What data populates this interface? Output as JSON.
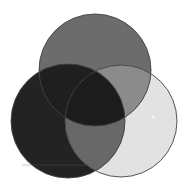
{
  "diagram": {
    "type": "venn",
    "canvas": {
      "width": 185,
      "height": 192,
      "background": "#ffffff"
    },
    "circles": [
      {
        "id": "top",
        "cx": 95,
        "cy": 70,
        "r": 56,
        "fill": "#6c6c6c"
      },
      {
        "id": "left",
        "cx": 68,
        "cy": 121,
        "r": 57,
        "fill": "#232323"
      },
      {
        "id": "right",
        "cx": 121,
        "cy": 121,
        "r": 56,
        "fill": "#e2e2e2"
      }
    ],
    "regions": {
      "top_right": "#8b8b8b",
      "left_right": "#686868",
      "top_left": "#1f1f1f",
      "center": "#1c1c1c"
    },
    "stroke": "#444444",
    "labels": []
  }
}
